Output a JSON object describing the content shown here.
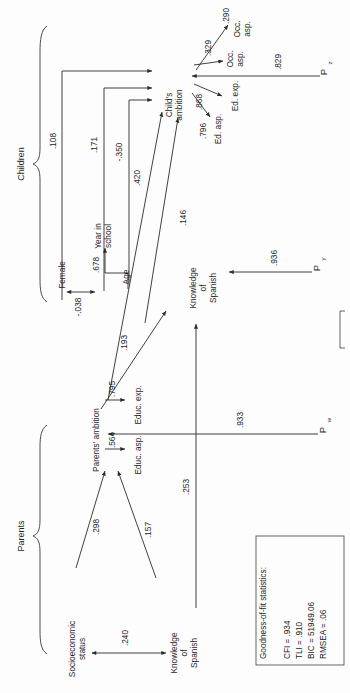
{
  "figure": {
    "orientation": "rotated-90-ccw"
  },
  "groups": [
    {
      "id": "children",
      "label": "Children"
    },
    {
      "id": "parents",
      "label": "Parents"
    }
  ],
  "nodes": [
    {
      "id": "female",
      "label": "Female"
    },
    {
      "id": "age",
      "label": "Age"
    },
    {
      "id": "year_in_school",
      "label": "Year in\nschool",
      "line1": "Year in",
      "line2": "school"
    },
    {
      "id": "child_ambition",
      "label": "Child's\nambition",
      "line1": "Child's",
      "line2": "ambition"
    },
    {
      "id": "occ_exp",
      "label": "Occ.\nexp.",
      "line1": "Occ.",
      "line2": "exp."
    },
    {
      "id": "occ_asp",
      "label": "Occ.\nasp.",
      "line1": "Occ.",
      "line2": "asp."
    },
    {
      "id": "ed_exp",
      "label": "Ed. exp."
    },
    {
      "id": "ed_asp",
      "label": "Ed. asp."
    },
    {
      "id": "knowledge_spanish_child",
      "label": "Knowledge\nof\nSpanish",
      "line1": "Knowledge",
      "line2": "of",
      "line3": "Spanish"
    },
    {
      "id": "parents_ambition",
      "label": "Parents' ambition"
    },
    {
      "id": "educ_exp",
      "label": "Educ. exp."
    },
    {
      "id": "educ_asp",
      "label": "Educ. asp."
    },
    {
      "id": "socioeconomic_status",
      "label": "Socioeconomic\nstatus",
      "line1": "Socioeconomic",
      "line2": "status"
    },
    {
      "id": "knowledge_spanish_parent",
      "label": "Knowledge\nof\nSpanish",
      "line1": "Knowledge",
      "line2": "of",
      "line3": "Spanish"
    },
    {
      "id": "p_z",
      "label": "P",
      "sub": "z"
    },
    {
      "id": "p_y",
      "label": "P",
      "sub": "y"
    },
    {
      "id": "p_w",
      "label": "P",
      "sub": "w"
    }
  ],
  "paths": [
    {
      "id": "female-to-child-ambition",
      "from": "female",
      "to": "child_ambition",
      "coef": ".108",
      "type": "directed"
    },
    {
      "id": "yearinschool-to-child-ambition",
      "from": "year_in_school",
      "to": "child_ambition",
      "coef": ".171",
      "type": "directed"
    },
    {
      "id": "age-to-child-ambition",
      "from": "age",
      "to": "child_ambition",
      "coef": "-.350",
      "type": "directed"
    },
    {
      "id": "female-age-correlation",
      "from": "female",
      "to": "age",
      "coef": "-.038",
      "type": "covariance"
    },
    {
      "id": "age-to-yearinschool",
      "from": "age",
      "to": "year_in_school",
      "coef": ".678",
      "type": "directed"
    },
    {
      "id": "parentsambition-to-childambition",
      "from": "parents_ambition",
      "to": "child_ambition",
      "coef": ".420",
      "type": "directed"
    },
    {
      "id": "knowledgespanish-to-childambition",
      "from": "knowledge_spanish_child",
      "to": "child_ambition",
      "coef": ".146",
      "type": "directed"
    },
    {
      "id": "parentsambition-to-knowledgespanish",
      "from": "parents_ambition",
      "to": "knowledge_spanish_child",
      "coef": ".193",
      "type": "directed"
    },
    {
      "id": "childambition-to-occexp",
      "from": "child_ambition",
      "to": "occ_exp",
      "coef": ".290",
      "type": "directed"
    },
    {
      "id": "childambition-to-occasp",
      "from": "child_ambition",
      "to": "occ_asp",
      "coef": ".329",
      "type": "directed"
    },
    {
      "id": "childambition-to-edexp",
      "from": "child_ambition",
      "to": "ed_exp",
      "coef": ".868",
      "type": "directed"
    },
    {
      "id": "childambition-to-edasp",
      "from": "child_ambition",
      "to": "ed_asp",
      "coef": ".796",
      "type": "directed"
    },
    {
      "id": "pz-to-childambition",
      "from": "p_z",
      "to": "child_ambition",
      "coef": ".829",
      "type": "directed"
    },
    {
      "id": "py-to-knowledgespanish",
      "from": "p_y",
      "to": "knowledge_spanish_child",
      "coef": ".936",
      "type": "directed"
    },
    {
      "id": "pw-to-parentsambition",
      "from": "p_w",
      "to": "parents_ambition",
      "coef": ".933",
      "type": "directed"
    },
    {
      "id": "parentsambition-to-educexp",
      "from": "parents_ambition",
      "to": "educ_exp",
      "coef": ".795",
      "type": "directed"
    },
    {
      "id": "parentsambition-to-educasp",
      "from": "parents_ambition",
      "to": "educ_asp",
      "coef": ".564",
      "type": "directed"
    },
    {
      "id": "ses-to-parentsambition",
      "from": "socioeconomic_status",
      "to": "parents_ambition",
      "coef": ".298",
      "type": "directed"
    },
    {
      "id": "knowledgespanishparent-to-parentsambition",
      "from": "knowledge_spanish_parent",
      "to": "parents_ambition",
      "coef": ".157",
      "type": "directed"
    },
    {
      "id": "knowledgespanishparent-to-knowledgespanishchild",
      "from": "knowledge_spanish_parent",
      "to": "knowledge_spanish_child",
      "coef": ".253",
      "type": "directed"
    },
    {
      "id": "ses-knowledgespanish-correlation",
      "from": "socioeconomic_status",
      "to": "knowledge_spanish_parent",
      "coef": ".240",
      "type": "covariance"
    }
  ],
  "fit_box": {
    "title": "Goodness-of-fit statistics:",
    "stats": [
      {
        "id": "cfi",
        "text": "CFI = .934"
      },
      {
        "id": "tli",
        "text": "TLI = .910"
      },
      {
        "id": "bic",
        "text": "BIC = 51949.06"
      },
      {
        "id": "rmsea",
        "text": "RMSEA = .06"
      }
    ]
  },
  "colors": {
    "line": "#2b2b2b",
    "text": "#1f1f1f",
    "background": "#fdfdfd",
    "box_border": "#555555"
  }
}
